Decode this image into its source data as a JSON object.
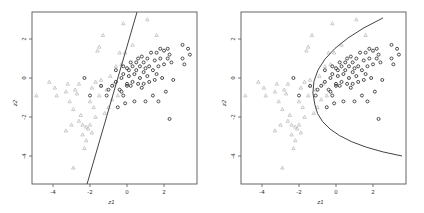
{
  "chart_data": [
    {
      "type": "scatter",
      "title": "",
      "xlabel": "z1",
      "ylabel": "z2",
      "xlim": [
        -5.2,
        3.8
      ],
      "ylim": [
        -5.4,
        3.4
      ],
      "xticks": [
        -4,
        -2,
        0,
        2
      ],
      "yticks": [
        2,
        0,
        -2,
        -4
      ],
      "grid": false,
      "legend": null,
      "boundary": {
        "type": "linear",
        "points": [
          [
            0.54,
            3.38
          ],
          [
            -2.16,
            -5.44
          ]
        ]
      },
      "series": [
        {
          "name": "class A",
          "marker": "triangle",
          "color": "#b5b5b5",
          "points": [
            [
              -4.9,
              -0.9
            ],
            [
              -3.9,
              -0.5
            ],
            [
              -3.8,
              -0.9
            ],
            [
              -3.2,
              -0.3
            ],
            [
              -3.3,
              -2.7
            ],
            [
              -3.0,
              -2.4
            ],
            [
              -2.9,
              -1.6
            ],
            [
              -2.8,
              -0.6
            ],
            [
              -2.7,
              -0.8
            ],
            [
              -2.5,
              -1.9
            ],
            [
              -2.4,
              -2.4
            ],
            [
              -2.4,
              -2.9
            ],
            [
              -2.3,
              -3.6
            ],
            [
              -2.2,
              -2.5
            ],
            [
              -2.2,
              -3.2
            ],
            [
              -2.1,
              -2.6
            ],
            [
              -2.0,
              -2.4
            ],
            [
              -2.0,
              -1.2
            ],
            [
              -1.9,
              -0.5
            ],
            [
              -1.8,
              -1.5
            ],
            [
              -1.7,
              -2.0
            ],
            [
              -1.7,
              -0.2
            ],
            [
              -1.6,
              1.4
            ],
            [
              -1.5,
              1.6
            ],
            [
              -1.4,
              -0.4
            ],
            [
              -1.3,
              2.2
            ],
            [
              -1.2,
              -1.8
            ],
            [
              -1.1,
              -0.6
            ],
            [
              -1.0,
              -1.5
            ],
            [
              -0.9,
              0.1
            ],
            [
              -0.8,
              -1.1
            ],
            [
              -0.6,
              0.6
            ],
            [
              -0.5,
              -0.9
            ],
            [
              -0.4,
              1.3
            ],
            [
              -0.3,
              0.7
            ],
            [
              -0.2,
              2.8
            ],
            [
              -0.1,
              1.3
            ],
            [
              0.3,
              1.7
            ],
            [
              1.1,
              3.0
            ],
            [
              1.6,
              2.2
            ],
            [
              -2.6,
              -0.3
            ],
            [
              -3.1,
              -1.2
            ],
            [
              -1.5,
              -0.9
            ],
            [
              -0.7,
              -0.3
            ],
            [
              -4.2,
              -0.2
            ],
            [
              -2.9,
              -4.6
            ],
            [
              -3.3,
              -0.7
            ],
            [
              -1.9,
              -2.8
            ],
            [
              -2.6,
              -2.2
            ],
            [
              -1.4,
              -0.1
            ]
          ]
        },
        {
          "name": "class B",
          "marker": "circle",
          "color": "#3a3a3a",
          "points": [
            [
              -2.3,
              0.0
            ],
            [
              -2.0,
              -0.9
            ],
            [
              -1.4,
              -0.4
            ],
            [
              -1.1,
              -0.9
            ],
            [
              -0.8,
              -0.4
            ],
            [
              -0.6,
              -0.2
            ],
            [
              -0.6,
              0.4
            ],
            [
              -0.5,
              -1.5
            ],
            [
              -0.4,
              -0.6
            ],
            [
              -0.3,
              -0.7
            ],
            [
              -0.3,
              0.0
            ],
            [
              -0.2,
              0.2
            ],
            [
              -0.2,
              -0.9
            ],
            [
              -0.1,
              -1.3
            ],
            [
              0.0,
              0.5
            ],
            [
              0.0,
              -0.3
            ],
            [
              0.1,
              0.1
            ],
            [
              0.1,
              0.4
            ],
            [
              0.2,
              -0.4
            ],
            [
              0.2,
              0.8
            ],
            [
              0.3,
              -0.2
            ],
            [
              0.4,
              0.2
            ],
            [
              0.4,
              -1.2
            ],
            [
              0.5,
              0.4
            ],
            [
              0.5,
              0.8
            ],
            [
              0.6,
              -0.3
            ],
            [
              0.6,
              1.0
            ],
            [
              0.7,
              0.0
            ],
            [
              0.7,
              0.6
            ],
            [
              0.8,
              -0.5
            ],
            [
              0.8,
              1.1
            ],
            [
              0.9,
              0.3
            ],
            [
              0.9,
              0.8
            ],
            [
              1.0,
              -1.2
            ],
            [
              1.0,
              0.5
            ],
            [
              1.1,
              1.0
            ],
            [
              1.1,
              0.1
            ],
            [
              1.2,
              0.6
            ],
            [
              1.2,
              -0.2
            ],
            [
              1.3,
              1.3
            ],
            [
              1.4,
              -0.9
            ],
            [
              1.4,
              0.4
            ],
            [
              1.5,
              0.9
            ],
            [
              1.5,
              -0.1
            ],
            [
              1.6,
              1.3
            ],
            [
              1.6,
              0.2
            ],
            [
              1.7,
              -1.2
            ],
            [
              1.7,
              0.6
            ],
            [
              1.8,
              1.0
            ],
            [
              1.9,
              0.0
            ],
            [
              2.0,
              1.4
            ],
            [
              2.0,
              0.7
            ],
            [
              2.1,
              -0.7
            ],
            [
              2.2,
              1.0
            ],
            [
              2.3,
              -2.1
            ],
            [
              2.3,
              1.2
            ],
            [
              2.4,
              0.8
            ],
            [
              2.5,
              -0.1
            ],
            [
              3.0,
              1.0
            ],
            [
              3.0,
              1.7
            ],
            [
              3.1,
              0.7
            ],
            [
              3.3,
              1.5
            ],
            [
              3.4,
              1.2
            ],
            [
              -1.0,
              -0.6
            ],
            [
              0.0,
              -0.4
            ],
            [
              0.3,
              0.6
            ],
            [
              1.8,
              1.5
            ],
            [
              2.2,
              1.5
            ],
            [
              -0.2,
              0.6
            ],
            [
              0.9,
              -0.3
            ]
          ]
        }
      ]
    },
    {
      "type": "scatter",
      "title": "",
      "xlabel": "z1",
      "ylabel": "z2",
      "xlim": [
        -5.2,
        3.8
      ],
      "ylim": [
        -5.4,
        3.4
      ],
      "xticks": [
        -4,
        -2,
        0,
        2
      ],
      "yticks": [
        2,
        0,
        -2,
        -4
      ],
      "grid": false,
      "legend": null,
      "boundary": {
        "type": "quadratic",
        "vertex": [
          -1.14,
          -1.38
        ],
        "top_end": [
          2.54,
          3.08
        ],
        "bottom_end": [
          3.57,
          -4.0
        ]
      },
      "series_ref": "same points as left panel"
    }
  ],
  "panels": [
    {
      "id": "left",
      "boundary_label": "linear decision boundary"
    },
    {
      "id": "right",
      "boundary_label": "quadratic decision boundary"
    }
  ],
  "colors": {
    "frame": "#555555",
    "boundary": "#444444",
    "class_a": "#b5b5b5",
    "class_b": "#3a3a3a"
  }
}
